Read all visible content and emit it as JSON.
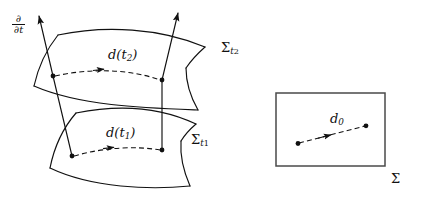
{
  "figure": {
    "background_color": "#ffffff",
    "stroke_color": "#111111",
    "labels": {
      "time_vector": {
        "numerator": "∂",
        "denominator": "∂t"
      },
      "displacement_t2": "d(t",
      "displacement_t2_sub": "2",
      "displacement_t2_close": ")",
      "displacement_t1": "d(t",
      "displacement_t1_sub": "1",
      "displacement_t1_close": ")",
      "sigma": "Σ",
      "sigma_t2_sub": "t",
      "sigma_t2_subsub": "2",
      "sigma_t1_sub": "t",
      "sigma_t1_subsub": "1",
      "displacement_0": "d",
      "displacement_0_sub": "0",
      "sigma_plain": "Σ"
    },
    "surfaces": [
      {
        "name": "upper-hypersurface",
        "label": "Σ t2",
        "description": "curved quadrilateral sheet, upper"
      },
      {
        "name": "lower-hypersurface",
        "label": "Σ t1",
        "description": "curved quadrilateral sheet, lower"
      },
      {
        "name": "abstract-manifold-box",
        "label": "Σ",
        "description": "flat rectangle at right"
      }
    ],
    "points": [
      {
        "name": "upper-left-point",
        "x": 53,
        "y": 76
      },
      {
        "name": "upper-right-point",
        "x": 162,
        "y": 80
      },
      {
        "name": "lower-left-point",
        "x": 72,
        "y": 156
      },
      {
        "name": "lower-right-point",
        "x": 162,
        "y": 150
      },
      {
        "name": "box-left-point",
        "x": 298,
        "y": 143
      },
      {
        "name": "box-right-point",
        "x": 366,
        "y": 126
      }
    ],
    "arrows": [
      {
        "name": "tangent-vector-left",
        "label": "∂/∂t"
      },
      {
        "name": "tangent-vector-right",
        "label": ""
      },
      {
        "name": "displacement-arrow-t2",
        "label": "d(t2)"
      },
      {
        "name": "displacement-arrow-t1",
        "label": "d(t1)"
      },
      {
        "name": "displacement-arrow-d0",
        "label": "d0"
      }
    ]
  }
}
